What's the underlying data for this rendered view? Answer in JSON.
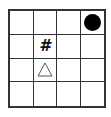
{
  "board": {
    "rows": 4,
    "cols": 4,
    "cells": [
      {
        "row": 0,
        "col": 3,
        "piece": "circle",
        "icon": "filled-circle-icon",
        "color": "#000000"
      },
      {
        "row": 1,
        "col": 1,
        "piece": "hash",
        "icon": "hash-icon",
        "text": "#"
      },
      {
        "row": 2,
        "col": 1,
        "piece": "triangle",
        "icon": "triangle-outline-icon",
        "text": "△"
      }
    ]
  },
  "colors": {
    "grid_line": "#333333",
    "background": "#ffffff"
  }
}
